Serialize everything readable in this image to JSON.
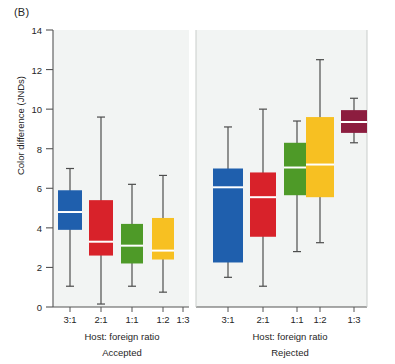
{
  "panel_label": "(B)",
  "axes": {
    "ylabel": "Color difference (JNDs)",
    "yticks": [
      0,
      2,
      4,
      6,
      8,
      10,
      12,
      14
    ],
    "ylim": [
      0,
      14
    ],
    "xlabel_left": "Host: foreign ratio",
    "xlabel_right": "Host: foreign ratio",
    "group_left": "Accepted",
    "group_right": "Rejected",
    "xticks": [
      "3:1",
      "2:1",
      "1:1",
      "1:2",
      "1:3"
    ]
  },
  "colors": {
    "blue": "#1f5fad",
    "red": "#d8222a",
    "green": "#4e9a28",
    "yellow": "#f7c022",
    "darkred": "#8c1d3f",
    "panel_bg": "#f2f4f3",
    "axis": "#555555",
    "whisker": "#4d4d4d",
    "median": "#ffffff"
  },
  "chart_data": {
    "type": "boxplot",
    "title": "",
    "xlabel": "Host: foreign ratio",
    "ylabel": "Color difference (JNDs)",
    "ylim": [
      0,
      14
    ],
    "yticks": [
      0,
      2,
      4,
      6,
      8,
      10,
      12,
      14
    ],
    "grid": false,
    "legend": "none",
    "panels": [
      {
        "name": "Accepted",
        "categories": [
          "3:1",
          "2:1",
          "1:1",
          "1:2",
          "1:3"
        ],
        "boxes": [
          {
            "category": "3:1",
            "color": "blue",
            "whisker_low": 1.05,
            "q1": 3.9,
            "median": 4.8,
            "q3": 5.9,
            "whisker_high": 7.0
          },
          {
            "category": "2:1",
            "color": "red",
            "whisker_low": 0.15,
            "q1": 2.6,
            "median": 3.3,
            "q3": 5.4,
            "whisker_high": 9.6
          },
          {
            "category": "1:1",
            "color": "green",
            "whisker_low": 1.05,
            "q1": 2.2,
            "median": 3.1,
            "q3": 4.2,
            "whisker_high": 6.2
          },
          {
            "category": "1:2",
            "color": "yellow",
            "whisker_low": 0.75,
            "q1": 2.4,
            "median": 2.85,
            "q3": 4.5,
            "whisker_high": 6.65
          },
          {
            "category": "1:3",
            "color": "darkred",
            "whisker_low": null,
            "q1": null,
            "median": null,
            "q3": null,
            "whisker_high": null
          }
        ]
      },
      {
        "name": "Rejected",
        "categories": [
          "3:1",
          "2:1",
          "1:1",
          "1:2",
          "1:3"
        ],
        "boxes": [
          {
            "category": "3:1",
            "color": "blue",
            "whisker_low": 1.5,
            "q1": 2.25,
            "median": 6.05,
            "q3": 7.0,
            "whisker_high": 9.1
          },
          {
            "category": "2:1",
            "color": "red",
            "whisker_low": 1.05,
            "q1": 3.55,
            "median": 5.55,
            "q3": 6.8,
            "whisker_high": 10.0
          },
          {
            "category": "1:1",
            "color": "green",
            "whisker_low": 2.8,
            "q1": 5.65,
            "median": 7.05,
            "q3": 8.3,
            "whisker_high": 9.4
          },
          {
            "category": "1:2",
            "color": "yellow",
            "whisker_low": 3.25,
            "q1": 5.55,
            "median": 7.2,
            "q3": 9.6,
            "whisker_high": 12.5
          },
          {
            "category": "1:3",
            "color": "darkred",
            "whisker_low": 8.3,
            "q1": 8.8,
            "median": 9.35,
            "q3": 9.95,
            "whisker_high": 10.55
          }
        ]
      }
    ]
  }
}
